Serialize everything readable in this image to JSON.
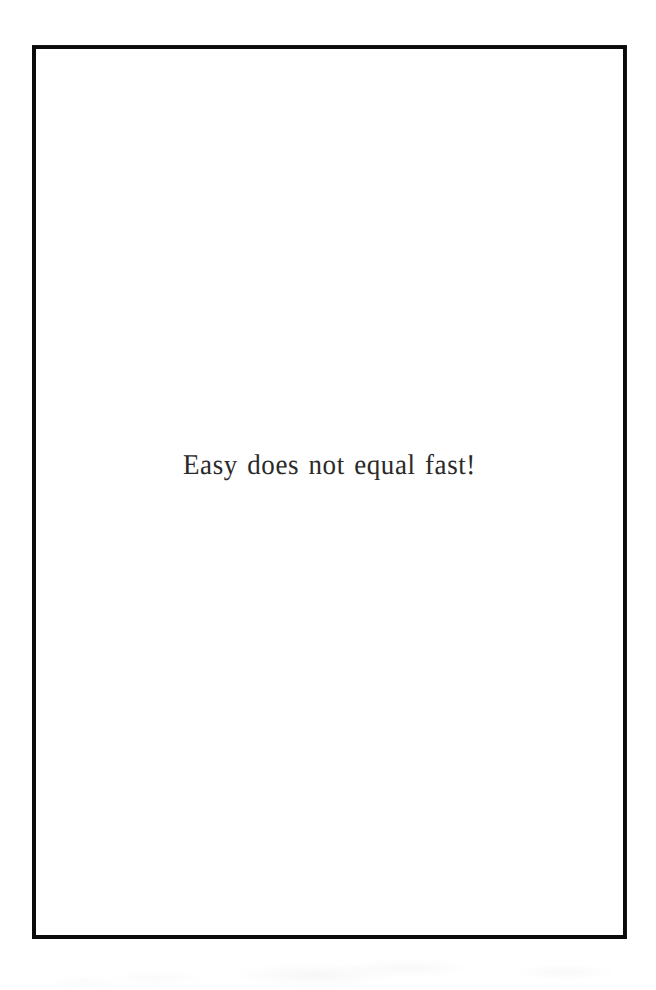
{
  "document": {
    "type": "scanned-book-page",
    "page_kind": "epigraph-page",
    "background_color": "#ffffff"
  },
  "frame": {
    "name": "printed-rule-border",
    "color": "#0b0b0b",
    "thickness_px": 4,
    "left_px": 32,
    "top_px": 45,
    "width_px": 595,
    "height_px": 894
  },
  "content": {
    "epigraph": "Easy does not equal fast!",
    "text_color": "#2a2a2a",
    "alignment": "center"
  }
}
